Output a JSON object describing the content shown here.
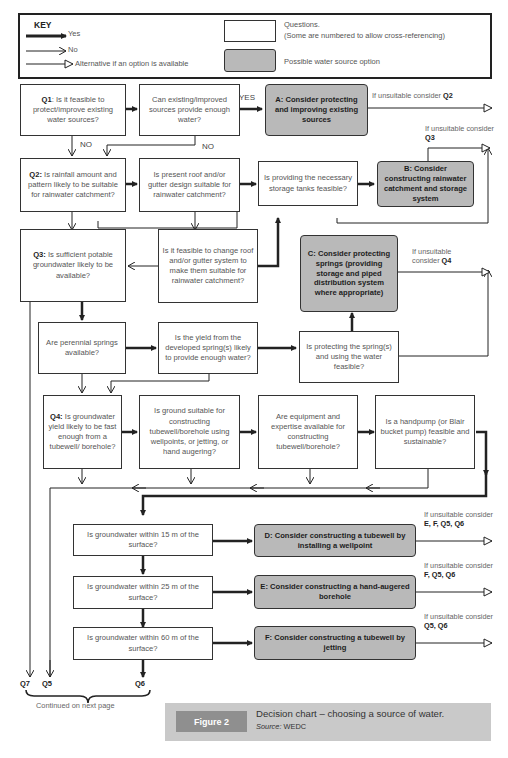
{
  "key": {
    "title": "KEY",
    "yes": "Yes",
    "no": "No",
    "alternative": "Alternative if an option is available",
    "questions_line1": "Questions.",
    "questions_line2": "(Some are numbered to allow cross-referencing)",
    "option": "Possible water source option"
  },
  "questions": {
    "q1": {
      "num": "Q1",
      "text": ": Is it feasible to protect/improve existing water sources?"
    },
    "existing_enough": {
      "text": "Can existing/improved sources provide enough water?"
    },
    "q2": {
      "num": "Q2:",
      "text": " Is rainfall amount and pattern likely to be suitable for rainwater catchment?"
    },
    "roof_suitable": {
      "text": "Is present roof and/or gutter design suitable for rainwater catchment?"
    },
    "storage_tanks": {
      "text": "Is providing the necessary storage tanks feasible?"
    },
    "q3": {
      "num": "Q3:",
      "text": " Is sufficient potable groundwater likely to be available?"
    },
    "change_roof": {
      "text": "Is it feasible to change roof and/or gutter system to make them suitable for rainwater catchment?"
    },
    "springs": {
      "text": "Are perennial springs available?"
    },
    "spring_yield": {
      "text": "Is the yield from the developed spring(s) likely to provide enough water?"
    },
    "protect_spring": {
      "text": "Is protecting the spring(s) and using the water feasible?"
    },
    "q4": {
      "num": "Q4:",
      "text": " Is groundwater yield likely to be fast enough from a tubewell/ borehole?"
    },
    "ground_suitable": {
      "text": "Is ground suitable for constructing tubewell/borehole using wellpoints, or jetting, or hand augering?"
    },
    "equipment": {
      "text": "Are equipment and expertise available for constructing tubewell/borehole?"
    },
    "handpump": {
      "text": "Is a handpump (or Blair bucket pump) feasible and sustainable?"
    },
    "gw15": {
      "text": "Is groundwater within 15 m of the surface?"
    },
    "gw25": {
      "text": "Is groundwater within 25 m of the surface?"
    },
    "gw60": {
      "text": "Is groundwater within 60 m of the surface?"
    }
  },
  "options": {
    "a": "A: Consider protecting and improving existing sources",
    "b": "B: Consider constructing rainwater catchment and storage system",
    "c": "C: Consider protecting springs (providing storage and piped distribution system where appropriate)",
    "d": "D: Consider constructing a tubewell by installing a wellpoint",
    "e": "E: Consider constructing a hand-augered borehole",
    "f": "F: Consider constructing a tubewell by jetting"
  },
  "notes": {
    "a": {
      "prefix": "If unsuitable consider ",
      "ref": "Q2"
    },
    "b": {
      "prefix": "If unsuitable consider ",
      "ref": "Q3"
    },
    "c": {
      "prefix": "If unsuitable consider ",
      "ref": "Q4"
    },
    "d": {
      "prefix": "If unsuitable consider",
      "ref": "E, F, Q5, Q6"
    },
    "e": {
      "prefix": "If unsuitable consider",
      "ref": "F, Q5, Q6"
    },
    "f": {
      "prefix": "If unsuitable consider",
      "ref": "Q5, Q6"
    }
  },
  "labels": {
    "yes": "YES",
    "no1": "NO",
    "no2": "NO"
  },
  "continuations": {
    "q7": "Q7",
    "q5": "Q5",
    "q6": "Q6",
    "continued": "Continued on next page"
  },
  "caption": {
    "tag": "Figure 2",
    "title": "Decision chart – choosing a source of water.",
    "source_label": "Source:",
    "source": "WEDC"
  },
  "colors": {
    "option_fill": "#b9b9b9",
    "caption_bg": "#c9c9c9",
    "figure_tag": "#8f8f8f",
    "line": "#222222"
  }
}
